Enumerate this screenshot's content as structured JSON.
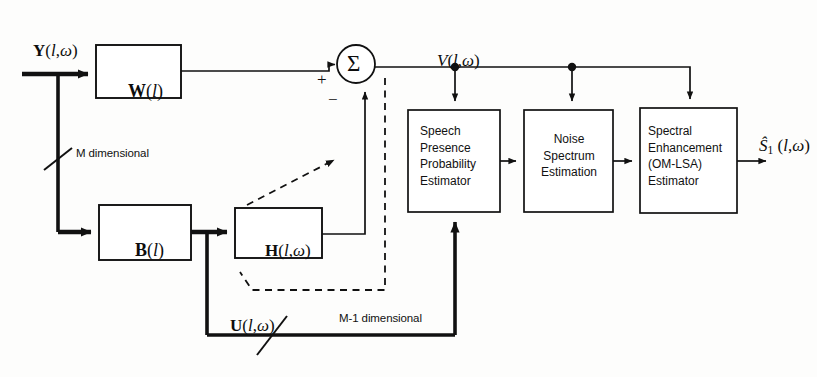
{
  "figure": {
    "type": "block-diagram",
    "background_color": "#fdfdfc",
    "line_color": "#111111"
  },
  "signals": {
    "input_label": "Y(l,ω)",
    "beamformer_output_label": "V(l,ω)",
    "blocking_output_label": "U(l,ω)",
    "final_output_label": "Ŝ1(l,ω)"
  },
  "annotations": {
    "m_dimensional": "M dimensional",
    "m_minus_1_dimensional": "M-1 dimensional",
    "plus_sign": "+",
    "minus_sign": "−",
    "summation_symbol": "Σ"
  },
  "blocks": [
    {
      "id": "w",
      "label": "W(l)",
      "style": "math"
    },
    {
      "id": "b",
      "label": "B(l)",
      "style": "math"
    },
    {
      "id": "h",
      "label": "H(l,ω)",
      "style": "math"
    },
    {
      "id": "spp",
      "lines": [
        "Speech",
        "Presence",
        "Probability",
        "Estimator"
      ],
      "style": "text"
    },
    {
      "id": "noise",
      "lines": [
        "Noise",
        "Spectrum",
        "Estimation"
      ],
      "style": "text"
    },
    {
      "id": "spectral",
      "lines": [
        "Spectral",
        "Enhancement",
        "(OM-LSA)",
        "Estimator"
      ],
      "style": "text"
    }
  ],
  "block_text": {
    "spp": "Speech\nPresence\nProbability\nEstimator",
    "noise": "Noise\nSpectrum\nEstimation",
    "spectral": "Spectral\nEnhancement\n(OM-LSA)\nEstimator"
  },
  "math_labels": {
    "w": "W(l)",
    "b": "B(l)",
    "h": "H(l,ω)"
  }
}
